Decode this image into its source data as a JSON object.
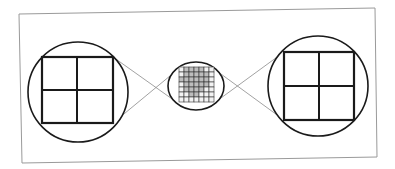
{
  "diagram": {
    "width": 395,
    "height": 169,
    "colors": {
      "background": "#ffffff",
      "frame": "#9a9a9a",
      "stroke": "#1a1a1a",
      "connector": "#8a8a8a",
      "cell_shade": "#bdbdbd",
      "cell_light": "#f2f2f2"
    },
    "frame": {
      "points": [
        [
          19,
          14
        ],
        [
          375,
          8
        ],
        [
          377,
          157
        ],
        [
          22,
          163
        ]
      ]
    },
    "left_magnifier": {
      "circle": {
        "cx": 78,
        "cy": 92,
        "r": 50
      },
      "square": {
        "x1": 42,
        "y1": 57,
        "x2": 113,
        "y2": 123,
        "mid_x": 77,
        "mid_y": 90
      }
    },
    "right_magnifier": {
      "circle": {
        "cx": 318,
        "cy": 86,
        "r": 50
      },
      "square": {
        "x1": 284,
        "y1": 52,
        "x2": 354,
        "y2": 120,
        "mid_x": 319,
        "mid_y": 86
      }
    },
    "center_detail": {
      "ellipse": {
        "cx": 196,
        "cy": 86,
        "rx": 28,
        "ry": 24
      },
      "grid": {
        "x": 179,
        "y": 67,
        "cols": 7,
        "rows": 7,
        "cell": 5
      },
      "shaded_cells": [
        [
          0,
          1
        ],
        [
          0,
          2
        ],
        [
          0,
          3
        ],
        [
          0,
          4
        ],
        [
          1,
          1
        ],
        [
          1,
          2
        ],
        [
          1,
          3
        ],
        [
          1,
          4
        ],
        [
          1,
          5
        ],
        [
          2,
          0
        ],
        [
          2,
          1
        ],
        [
          2,
          2
        ],
        [
          2,
          3
        ],
        [
          2,
          4
        ],
        [
          2,
          5
        ],
        [
          3,
          1
        ],
        [
          3,
          2
        ],
        [
          3,
          3
        ],
        [
          3,
          4
        ],
        [
          3,
          5
        ],
        [
          4,
          1
        ],
        [
          4,
          2
        ],
        [
          4,
          3
        ],
        [
          4,
          4
        ],
        [
          5,
          2
        ],
        [
          5,
          3
        ]
      ]
    },
    "connectors": [
      {
        "from": [
          113,
          57
        ],
        "to": [
          182,
          106
        ]
      },
      {
        "from": [
          113,
          123
        ],
        "to": [
          182,
          66
        ]
      },
      {
        "from": [
          210,
          66
        ],
        "to": [
          284,
          120
        ]
      },
      {
        "from": [
          210,
          106
        ],
        "to": [
          284,
          52
        ]
      }
    ]
  }
}
